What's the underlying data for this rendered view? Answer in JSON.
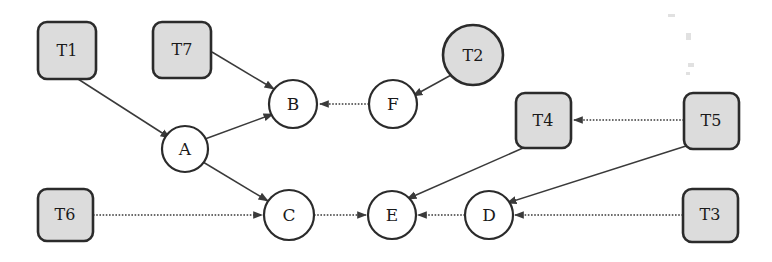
{
  "diagram": {
    "background_color": "#ffffff",
    "shape_fill_gray": "#dcdcdc",
    "shape_fill_white": "#ffffff",
    "stroke_color": "#2b2b2b",
    "edge_color": "#3a3a3a",
    "nodes": [
      {
        "id": "T1",
        "label": "T1",
        "shape": "rounded-box",
        "fill": "gray",
        "x": 38,
        "y": 22,
        "w": 58,
        "h": 57
      },
      {
        "id": "T7",
        "label": "T7",
        "shape": "rounded-box",
        "fill": "gray",
        "x": 153,
        "y": 22,
        "w": 58,
        "h": 56
      },
      {
        "id": "T2",
        "label": "T2",
        "shape": "circle",
        "fill": "gray",
        "cx": 473,
        "cy": 55,
        "r": 30
      },
      {
        "id": "T4",
        "label": "T4",
        "shape": "rounded-box",
        "fill": "gray",
        "x": 516,
        "y": 93,
        "w": 55,
        "h": 55
      },
      {
        "id": "T5",
        "label": "T5",
        "shape": "rounded-box",
        "fill": "gray",
        "x": 684,
        "y": 93,
        "w": 55,
        "h": 56
      },
      {
        "id": "T6",
        "label": "T6",
        "shape": "rounded-box",
        "fill": "gray",
        "x": 38,
        "y": 189,
        "w": 55,
        "h": 52
      },
      {
        "id": "T3",
        "label": "T3",
        "shape": "rounded-box",
        "fill": "gray",
        "x": 683,
        "y": 189,
        "w": 55,
        "h": 53
      },
      {
        "id": "A",
        "label": "A",
        "shape": "circle",
        "fill": "white",
        "cx": 185,
        "cy": 149,
        "r": 23
      },
      {
        "id": "B",
        "label": "B",
        "shape": "circle",
        "fill": "white",
        "cx": 293,
        "cy": 104,
        "r": 24
      },
      {
        "id": "F",
        "label": "F",
        "shape": "circle",
        "fill": "white",
        "cx": 393,
        "cy": 104,
        "r": 24
      },
      {
        "id": "C",
        "label": "C",
        "shape": "circle",
        "fill": "white",
        "cx": 289,
        "cy": 215,
        "r": 25
      },
      {
        "id": "E",
        "label": "E",
        "shape": "circle",
        "fill": "white",
        "cx": 392,
        "cy": 215,
        "r": 24
      },
      {
        "id": "D",
        "label": "D",
        "shape": "circle",
        "fill": "white",
        "cx": 489,
        "cy": 215,
        "r": 24
      }
    ],
    "edges": [
      {
        "from": "T1",
        "to": "A",
        "style": "solid",
        "x1": 78,
        "y1": 79,
        "x2": 170,
        "y2": 138
      },
      {
        "from": "T7",
        "to": "B",
        "style": "solid",
        "x1": 212,
        "y1": 52,
        "x2": 274,
        "y2": 89
      },
      {
        "from": "A",
        "to": "B",
        "style": "solid",
        "x1": 205,
        "y1": 139,
        "x2": 273,
        "y2": 114
      },
      {
        "from": "F",
        "to": "B",
        "style": "dotted",
        "x1": 369,
        "y1": 104,
        "x2": 319,
        "y2": 104
      },
      {
        "from": "T2",
        "to": "F",
        "style": "solid",
        "x1": 453,
        "y1": 74,
        "x2": 412,
        "y2": 97
      },
      {
        "from": "A",
        "to": "C",
        "style": "solid",
        "x1": 203,
        "y1": 162,
        "x2": 268,
        "y2": 200
      },
      {
        "from": "T6",
        "to": "C",
        "style": "dotted",
        "x1": 93,
        "y1": 215,
        "x2": 262,
        "y2": 215
      },
      {
        "from": "C",
        "to": "E",
        "style": "dotted",
        "x1": 314,
        "y1": 215,
        "x2": 366,
        "y2": 215
      },
      {
        "from": "D",
        "to": "E",
        "style": "dotted",
        "x1": 465,
        "y1": 215,
        "x2": 418,
        "y2": 215
      },
      {
        "from": "T3",
        "to": "D",
        "style": "dotted",
        "x1": 683,
        "y1": 215,
        "x2": 515,
        "y2": 215
      },
      {
        "from": "T4",
        "to": "E",
        "style": "solid",
        "x1": 522,
        "y1": 148,
        "x2": 407,
        "y2": 198
      },
      {
        "from": "T5",
        "to": "T4",
        "style": "dotted",
        "x1": 684,
        "y1": 120,
        "x2": 575,
        "y2": 120
      },
      {
        "from": "T5",
        "to": "D",
        "style": "solid",
        "x1": 686,
        "y1": 145,
        "x2": 506,
        "y2": 202
      }
    ]
  }
}
